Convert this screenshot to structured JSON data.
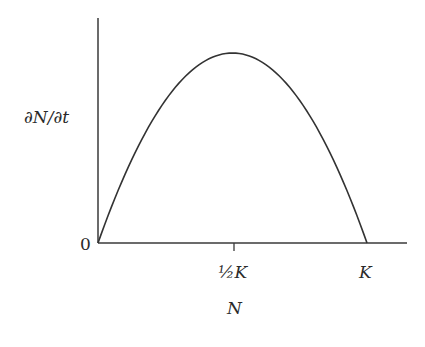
{
  "chart_data": {
    "type": "line",
    "title": "",
    "xlabel": "N",
    "ylabel": "∂N/∂t",
    "x_ticks": [
      {
        "value": 0,
        "label": "0"
      },
      {
        "value": 0.5,
        "label": "½K"
      },
      {
        "value": 1,
        "label": "K"
      }
    ],
    "y_ticks": [
      {
        "value": 0,
        "label": "0"
      }
    ],
    "series": [
      {
        "name": "logistic growth rate",
        "x": [
          0,
          0.1,
          0.2,
          0.3,
          0.4,
          0.5,
          0.6,
          0.7,
          0.8,
          0.9,
          1.0
        ],
        "y": [
          0,
          0.36,
          0.64,
          0.84,
          0.96,
          1.0,
          0.96,
          0.84,
          0.64,
          0.36,
          0
        ]
      }
    ],
    "xlim": [
      0,
      1.15
    ],
    "ylim": [
      0,
      1.18
    ],
    "grid": false,
    "legend": "none"
  },
  "labels": {
    "y_axis": "∂N/∂t",
    "x_axis": "N",
    "origin": "0",
    "half_k": "½K",
    "k": "K"
  },
  "colors": {
    "axis": "#3a3a3a",
    "curve": "#333333",
    "text": "#2a2a2a"
  }
}
